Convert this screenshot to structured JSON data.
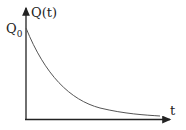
{
  "diagram": {
    "y_label": "Q(t)",
    "x_label": "t",
    "initial_label": "Q",
    "initial_sub": "0",
    "curve": "exponential decay",
    "colors": {
      "axis": "#222222",
      "curve": "#555555"
    }
  }
}
